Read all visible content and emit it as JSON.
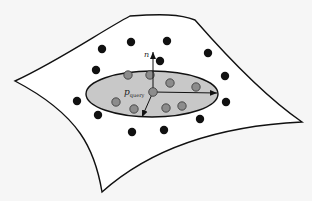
{
  "figure": {
    "colors": {
      "background": "#f6f6f6",
      "surface_fill": "#ffffff",
      "outline": "#111111",
      "ellipse_fill": "#c8c8c8",
      "inner_point": "#8c8c8c",
      "outer_point": "#111111"
    },
    "labels": {
      "normal": "n",
      "query_main": "p",
      "query_sub": "query"
    },
    "surface_path": "M15,81 C60,60 100,32 130,16 C160,14 180,14 195,20 C230,60 270,100 302,122 C240,125 160,140 102,192 C95,150 80,115 15,81 Z",
    "ellipse": {
      "cx": 152,
      "cy": 94,
      "rx": 66,
      "ry": 23
    },
    "query_point": {
      "x": 153,
      "y": 92
    },
    "arrows": [
      {
        "name": "normal-arrow",
        "x2": 153,
        "y2": 52
      },
      {
        "name": "major-axis-arrow",
        "x2": 217,
        "y2": 93
      },
      {
        "name": "minor-axis-arrow",
        "x2": 142,
        "y2": 117
      }
    ],
    "inner_points": [
      {
        "x": 128,
        "y": 75
      },
      {
        "x": 150,
        "y": 75
      },
      {
        "x": 170,
        "y": 83
      },
      {
        "x": 196,
        "y": 87
      },
      {
        "x": 116,
        "y": 102
      },
      {
        "x": 134,
        "y": 109
      },
      {
        "x": 166,
        "y": 108
      },
      {
        "x": 182,
        "y": 106
      }
    ],
    "outer_points": [
      {
        "x": 102,
        "y": 49
      },
      {
        "x": 131,
        "y": 42
      },
      {
        "x": 167,
        "y": 41
      },
      {
        "x": 208,
        "y": 53
      },
      {
        "x": 96,
        "y": 70
      },
      {
        "x": 160,
        "y": 61
      },
      {
        "x": 225,
        "y": 76
      },
      {
        "x": 77,
        "y": 101
      },
      {
        "x": 226,
        "y": 102
      },
      {
        "x": 98,
        "y": 115
      },
      {
        "x": 200,
        "y": 119
      },
      {
        "x": 132,
        "y": 132
      },
      {
        "x": 164,
        "y": 130
      }
    ]
  }
}
